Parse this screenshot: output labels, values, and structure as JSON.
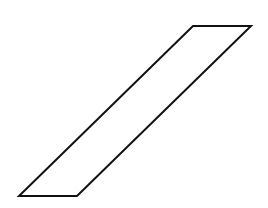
{
  "diagram": {
    "type": "parallelogram",
    "stroke_color": "#111111",
    "fill_color": "#ffffff",
    "stroke_width": 2,
    "vertices": [
      {
        "x": 193,
        "y": 26
      },
      {
        "x": 251,
        "y": 26
      },
      {
        "x": 77,
        "y": 196
      },
      {
        "x": 19,
        "y": 196
      }
    ]
  }
}
